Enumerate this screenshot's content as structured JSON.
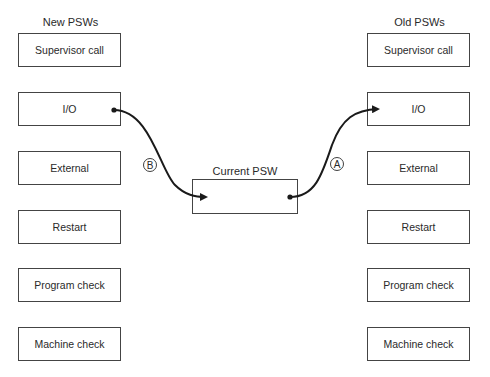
{
  "new_psws": {
    "title": "New PSWs",
    "items": [
      "Supervisor call",
      "I/O",
      "External",
      "Restart",
      "Program check",
      "Machine check"
    ]
  },
  "old_psws": {
    "title": "Old PSWs",
    "items": [
      "Supervisor call",
      "I/O",
      "External",
      "Restart",
      "Program check",
      "Machine check"
    ]
  },
  "current_psw": {
    "title": "Current PSW"
  },
  "arrows": [
    {
      "label": "A",
      "from": "Current PSW",
      "to": "Old PSWs: I/O"
    },
    {
      "label": "B",
      "from": "New PSWs: I/O",
      "to": "Current PSW"
    }
  ]
}
